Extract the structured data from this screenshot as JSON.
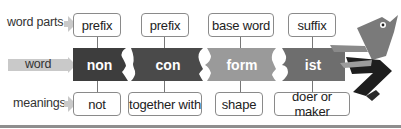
{
  "rows": {
    "word_parts_label": "word parts",
    "word_label": "word",
    "meanings_label": "meanings"
  },
  "parts": [
    {
      "type": "prefix",
      "piece": "non",
      "meaning": "not",
      "color": "#3d3d3d"
    },
    {
      "type": "prefix",
      "piece": "con",
      "meaning": "together with",
      "color": "#4a4a4a"
    },
    {
      "type": "base word",
      "piece": "form",
      "meaning": "shape",
      "color": "#9a9a9a"
    },
    {
      "type": "suffix",
      "piece": "ist",
      "meaning": "doer or maker",
      "color": "#6e6e6e"
    }
  ],
  "colors": {
    "arrow": "#c9c9c9",
    "box_border": "#8a8a8a",
    "bottom_rule": "#8e8e8e"
  },
  "illustration": "bird-character-icon"
}
